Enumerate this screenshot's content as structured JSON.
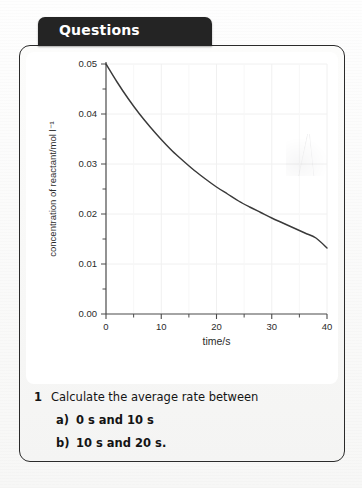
{
  "tab": {
    "label": "Questions"
  },
  "questions": {
    "items": [
      {
        "number": "1",
        "text": "Calculate the average rate between",
        "subitems": [
          {
            "marker": "a)",
            "text": "0 s and 10 s"
          },
          {
            "marker": "b)",
            "text": "10 s and 20 s."
          }
        ]
      }
    ]
  },
  "chart_data": {
    "type": "line",
    "title": "",
    "xlabel": "time/s",
    "ylabel": "concentration of reactant/mol l⁻¹",
    "xlim": [
      0,
      40
    ],
    "ylim": [
      0,
      0.05
    ],
    "xticks": [
      0,
      10,
      20,
      30,
      40
    ],
    "xtick_labels": [
      "0",
      "10",
      "20",
      "30",
      "40"
    ],
    "xminor_ticks": [
      5,
      15,
      25,
      35
    ],
    "yticks": [
      0.0,
      0.01,
      0.02,
      0.03,
      0.04,
      0.05
    ],
    "ytick_labels": [
      "0.00",
      "0.01",
      "0.02",
      "0.03",
      "0.04",
      "0.05"
    ],
    "yminor_ticks": [
      0.005,
      0.015,
      0.025,
      0.035,
      0.045
    ],
    "grid": true,
    "grid_color": "#f0f0f0",
    "legend": "none",
    "line_color": "#3a3a3a",
    "axis_color": "#4a4a4a",
    "series": [
      {
        "name": "concentration of reactant",
        "x": [
          0,
          2,
          4,
          6,
          8,
          10,
          12,
          14,
          16,
          18,
          20,
          22,
          24,
          26,
          28,
          30,
          32,
          34,
          36,
          38,
          40
        ],
        "values": [
          0.05,
          0.0464,
          0.0431,
          0.0401,
          0.0374,
          0.0349,
          0.0326,
          0.0306,
          0.0287,
          0.027,
          0.0254,
          0.024,
          0.0226,
          0.0214,
          0.0203,
          0.0192,
          0.0182,
          0.0172,
          0.0162,
          0.0152,
          0.0132
        ]
      }
    ],
    "annotations": []
  }
}
